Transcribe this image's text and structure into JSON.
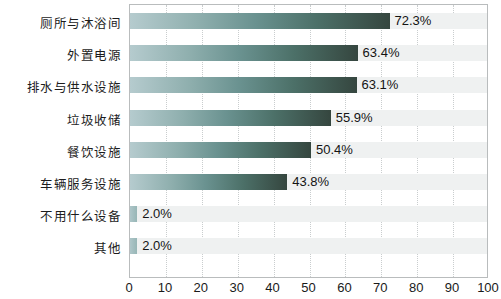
{
  "chart_data": {
    "type": "bar",
    "orientation": "horizontal",
    "title": "",
    "subtitle": "",
    "xlabel": "",
    "ylabel": "",
    "xlim": [
      0,
      100
    ],
    "xticks": [
      "0",
      "10",
      "20",
      "30",
      "40",
      "50",
      "60",
      "70",
      "80",
      "90",
      "100"
    ],
    "grid": "vertical-dotted",
    "legend": "none",
    "categories": [
      "厕所与沐浴间",
      "外置电源",
      "排水与供水设施",
      "垃圾收储",
      "餐饮设施",
      "车辆服务设施",
      "不用什么设备",
      "其他"
    ],
    "values": [
      72.3,
      63.4,
      63.1,
      55.9,
      50.4,
      43.8,
      2.0,
      2.0
    ],
    "value_labels": [
      "72.3%",
      "63.4%",
      "63.1%",
      "55.9%",
      "50.4%",
      "43.8%",
      "2.0%",
      "2.0%"
    ],
    "colors": {
      "bar_gradient_start": "#b5cbce",
      "bar_gradient_end": "#35463f",
      "track_band": "#eff1f1",
      "gridline": "#c9cdce",
      "axis_border": "#b9bcbd",
      "text": "#1a1a1a",
      "background": "#ffffff"
    }
  }
}
